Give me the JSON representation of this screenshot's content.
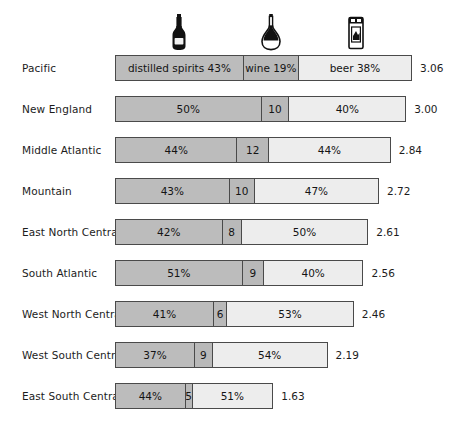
{
  "chart_data": {
    "type": "bar",
    "subtype": "stacked-horizontal-100pct",
    "title": "",
    "xlabel": "",
    "ylabel": "",
    "grid": false,
    "legend_position": "top-icons",
    "categories": [
      "Pacific",
      "New England",
      "Middle Atlantic",
      "Mountain",
      "East North Central",
      "South Atlantic",
      "West North Central",
      "West South Central",
      "East South Central"
    ],
    "series": [
      {
        "name": "distilled spirits",
        "icon": "liquor-bottle-icon",
        "values": [
          43,
          50,
          44,
          43,
          42,
          51,
          41,
          37,
          44
        ]
      },
      {
        "name": "wine",
        "icon": "wine-decanter-icon",
        "values": [
          19,
          10,
          12,
          10,
          8,
          9,
          6,
          9,
          5
        ]
      },
      {
        "name": "beer",
        "icon": "beer-can-icon",
        "values": [
          38,
          40,
          44,
          47,
          50,
          40,
          53,
          54,
          51
        ]
      }
    ],
    "totals": [
      3.06,
      3.0,
      2.84,
      2.72,
      2.61,
      2.56,
      2.46,
      2.19,
      1.63
    ],
    "totals_max": 3.06,
    "colors": {
      "spirits": "#bcbcbc",
      "wine": "#b9b9b9",
      "beer": "#ededed",
      "outline": "#4a4a4a",
      "text": "#1c1c1c",
      "background": "#ffffff"
    }
  },
  "rows": [
    {
      "label": "Pacific",
      "total": "3.06",
      "segments": [
        {
          "label": "distilled spirits 43%",
          "value": 43,
          "kind": "spirits"
        },
        {
          "label": "wine 19%",
          "value": 19,
          "kind": "wine"
        },
        {
          "label": "beer 38%",
          "value": 38,
          "kind": "beer"
        }
      ]
    },
    {
      "label": "New England",
      "total": "3.00",
      "segments": [
        {
          "label": "50%",
          "value": 50,
          "kind": "spirits"
        },
        {
          "label": "10",
          "value": 10,
          "kind": "wine"
        },
        {
          "label": "40%",
          "value": 40,
          "kind": "beer"
        }
      ]
    },
    {
      "label": "Middle Atlantic",
      "total": "2.84",
      "segments": [
        {
          "label": "44%",
          "value": 44,
          "kind": "spirits"
        },
        {
          "label": "12",
          "value": 12,
          "kind": "wine"
        },
        {
          "label": "44%",
          "value": 44,
          "kind": "beer"
        }
      ]
    },
    {
      "label": "Mountain",
      "total": "2.72",
      "segments": [
        {
          "label": "43%",
          "value": 43,
          "kind": "spirits"
        },
        {
          "label": "10",
          "value": 10,
          "kind": "wine"
        },
        {
          "label": "47%",
          "value": 47,
          "kind": "beer"
        }
      ]
    },
    {
      "label": "East North Central",
      "total": "2.61",
      "segments": [
        {
          "label": "42%",
          "value": 42,
          "kind": "spirits"
        },
        {
          "label": "8",
          "value": 8,
          "kind": "wine"
        },
        {
          "label": "50%",
          "value": 50,
          "kind": "beer"
        }
      ]
    },
    {
      "label": "South Atlantic",
      "total": "2.56",
      "segments": [
        {
          "label": "51%",
          "value": 51,
          "kind": "spirits"
        },
        {
          "label": "9",
          "value": 9,
          "kind": "wine"
        },
        {
          "label": "40%",
          "value": 40,
          "kind": "beer"
        }
      ]
    },
    {
      "label": "West North Central",
      "total": "2.46",
      "segments": [
        {
          "label": "41%",
          "value": 41,
          "kind": "spirits"
        },
        {
          "label": "6",
          "value": 6,
          "kind": "wine"
        },
        {
          "label": "53%",
          "value": 53,
          "kind": "beer"
        }
      ]
    },
    {
      "label": "West South Central",
      "total": "2.19",
      "segments": [
        {
          "label": "37%",
          "value": 37,
          "kind": "spirits"
        },
        {
          "label": "9",
          "value": 9,
          "kind": "wine"
        },
        {
          "label": "54%",
          "value": 54,
          "kind": "beer"
        }
      ]
    },
    {
      "label": "East South Central",
      "total": "1.63",
      "segments": [
        {
          "label": "44%",
          "value": 44,
          "kind": "spirits"
        },
        {
          "label": "5",
          "value": 5,
          "kind": "wine"
        },
        {
          "label": "51%",
          "value": 51,
          "kind": "beer"
        }
      ]
    }
  ],
  "header_icons": [
    {
      "name": "liquor-bottle-icon",
      "meaning": "distilled spirits"
    },
    {
      "name": "wine-decanter-icon",
      "meaning": "wine"
    },
    {
      "name": "beer-can-icon",
      "meaning": "beer"
    }
  ],
  "layout": {
    "bar_left": 115,
    "bar_max_width": 297,
    "total_x": 419,
    "first_row_top": 51,
    "row_pitch": 41
  }
}
